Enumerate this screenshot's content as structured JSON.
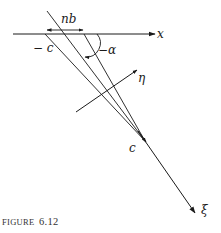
{
  "figure": {
    "caption_prefix": "FIGURE",
    "caption_number": "6.12",
    "labels": {
      "x_axis": "x",
      "xi_axis": "ξ",
      "eta_axis": "η",
      "nb": "nb",
      "minus_c": "− c",
      "minus_alpha": "−α",
      "c": "c"
    },
    "colors": {
      "line": "#1a1a1a",
      "background": "#ffffff"
    }
  }
}
